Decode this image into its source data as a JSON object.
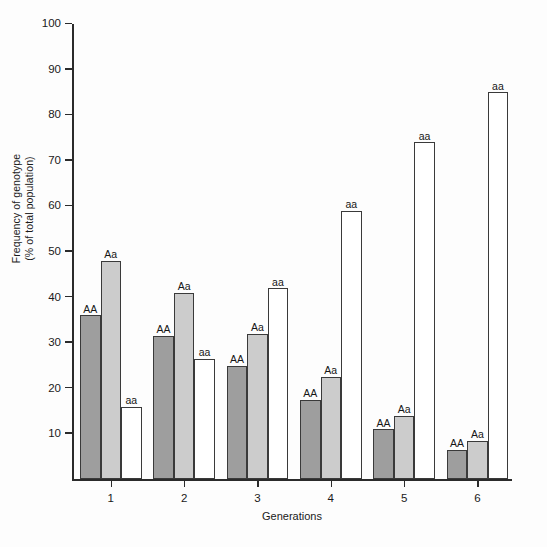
{
  "chart_data": {
    "type": "bar",
    "title": "",
    "xlabel": "Generations",
    "ylabel": "Frequency of genotype\n(% of total population)",
    "categories": [
      "1",
      "2",
      "3",
      "4",
      "5",
      "6"
    ],
    "ylim": [
      0,
      100
    ],
    "ytick_labels": [
      "10",
      "20",
      "30",
      "40",
      "50",
      "60",
      "70",
      "80",
      "90",
      "100"
    ],
    "ytick_values": [
      10,
      20,
      30,
      40,
      50,
      60,
      70,
      80,
      90,
      100
    ],
    "grid": false,
    "legend": "none (bars labelled directly)",
    "series": [
      {
        "name": "AA",
        "color": "#9e9e9e",
        "values": [
          36,
          31.5,
          25,
          17.5,
          11,
          6.5
        ]
      },
      {
        "name": "Aa",
        "color": "#cccccc",
        "values": [
          48,
          41,
          32,
          22.5,
          14,
          8.5
        ]
      },
      {
        "name": "aa",
        "color": "#ffffff",
        "values": [
          16,
          26.5,
          42,
          59,
          74,
          85
        ]
      }
    ],
    "bar_labels": [
      [
        "AA",
        "Aa",
        "aa"
      ],
      [
        "AA",
        "Aa",
        "aa"
      ],
      [
        "AA",
        "Aa",
        "aa"
      ],
      [
        "AA",
        "Aa",
        "aa"
      ],
      [
        "AA",
        "Aa",
        "aa"
      ],
      [
        "AA",
        "Aa",
        "aa"
      ]
    ],
    "colors": {
      "bar_AA": "#9e9e9e",
      "bar_Aa": "#cccccc",
      "bar_aa": "#ffffff",
      "bar_outline": "#3a3a3a",
      "axis": "#2b2b2b",
      "text": "#1a1a1a",
      "background": "#fdfdfd"
    }
  }
}
